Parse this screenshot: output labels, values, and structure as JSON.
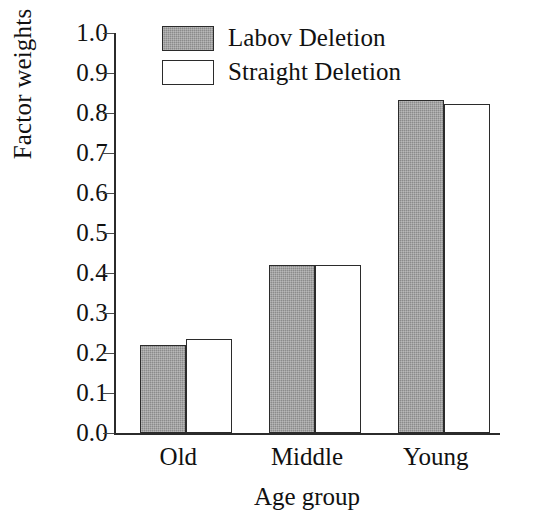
{
  "chart_data": {
    "type": "bar",
    "title": "",
    "xlabel": "Age group",
    "ylabel": "Factor weights",
    "categories": [
      "Old",
      "Middle",
      "Young"
    ],
    "series": [
      {
        "name": "Labov Deletion",
        "values": [
          0.22,
          0.42,
          0.832
        ],
        "fill": "#8b8b8b",
        "style": "filled"
      },
      {
        "name": "Straight Deletion",
        "values": [
          0.235,
          0.42,
          0.822
        ],
        "fill": "#ffffff",
        "style": "hollow"
      }
    ],
    "ylim": [
      0.0,
      1.0
    ],
    "yticks": [
      0.0,
      0.1,
      0.2,
      0.3,
      0.4,
      0.5,
      0.6,
      0.7,
      0.8,
      0.9,
      1.0
    ],
    "yticklabels": [
      "0.0",
      "0.1",
      "0.2",
      "0.3",
      "0.4",
      "0.5",
      "0.6",
      "0.7",
      "0.8",
      "0.9",
      "1.0"
    ],
    "grid": false,
    "legend_position": "upper-center-left",
    "legend_frame": false,
    "axis_color": "#2b2b2b",
    "text_color": "#111111",
    "background": "#ffffff"
  }
}
